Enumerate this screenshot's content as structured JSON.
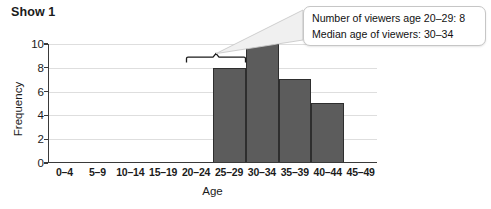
{
  "chart_data": {
    "type": "bar",
    "title": "Show 1",
    "xlabel": "Age",
    "ylabel": "Frequency",
    "categories": [
      "0–4",
      "5–9",
      "10–14",
      "15–19",
      "20–24",
      "25–29",
      "30–34",
      "35–39",
      "40–44",
      "45–49"
    ],
    "values": [
      0,
      0,
      0,
      0,
      0,
      8,
      10,
      7,
      5,
      0
    ],
    "ylim": [
      0,
      10
    ],
    "yticks": [
      0,
      2,
      4,
      6,
      8,
      10
    ],
    "ytick_labels": [
      "0",
      "2",
      "4",
      "6",
      "8",
      "10"
    ],
    "grid": true,
    "legend": false,
    "bar_color": "#5c5c5c",
    "bar_edge_color": "#2e2e2e",
    "annotations": [
      {
        "type": "callout",
        "lines": [
          "Number of viewers age 20–29: 8",
          "Median age of viewers: 30–34"
        ],
        "bracket_spans": [
          "20–24",
          "25–29"
        ],
        "bracket_value": 8.7
      }
    ]
  },
  "callout": {
    "line1": "Number of viewers age 20–29: 8",
    "line2": "Median age of viewers: 30–34"
  }
}
